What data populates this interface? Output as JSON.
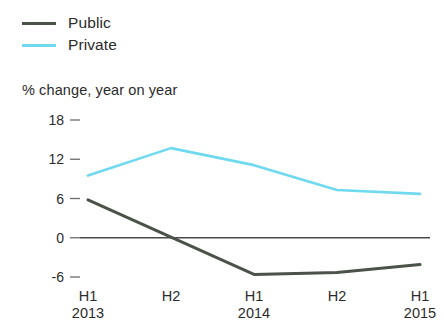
{
  "chart_data": {
    "type": "line",
    "title": "",
    "subtitle": "",
    "xlabel": "",
    "ylabel": "% change, year on year",
    "categories": [
      "H1",
      "H2",
      "H1",
      "H2",
      "H1"
    ],
    "category_years": [
      "2013",
      "",
      "2014",
      "",
      "2015"
    ],
    "ylim": [
      -6,
      18
    ],
    "yticks": [
      18,
      12,
      6,
      0,
      -6
    ],
    "ytick_labels": [
      "18",
      "12",
      "6",
      "0",
      "-6"
    ],
    "grid": false,
    "zero_line": true,
    "legend_position": "top-left",
    "series": [
      {
        "name": "Public",
        "color": "#4a5348",
        "values": [
          5.8,
          0.1,
          -5.6,
          -5.3,
          -4.1
        ]
      },
      {
        "name": "Private",
        "color": "#6fd9f0",
        "values": [
          9.5,
          13.7,
          11.1,
          7.3,
          6.7
        ]
      }
    ]
  },
  "legend": {
    "items": [
      {
        "label": "Public",
        "color": "#4a5348"
      },
      {
        "label": "Private",
        "color": "#6fd9f0"
      }
    ]
  },
  "axis": {
    "y_title": "% change, year on year"
  }
}
